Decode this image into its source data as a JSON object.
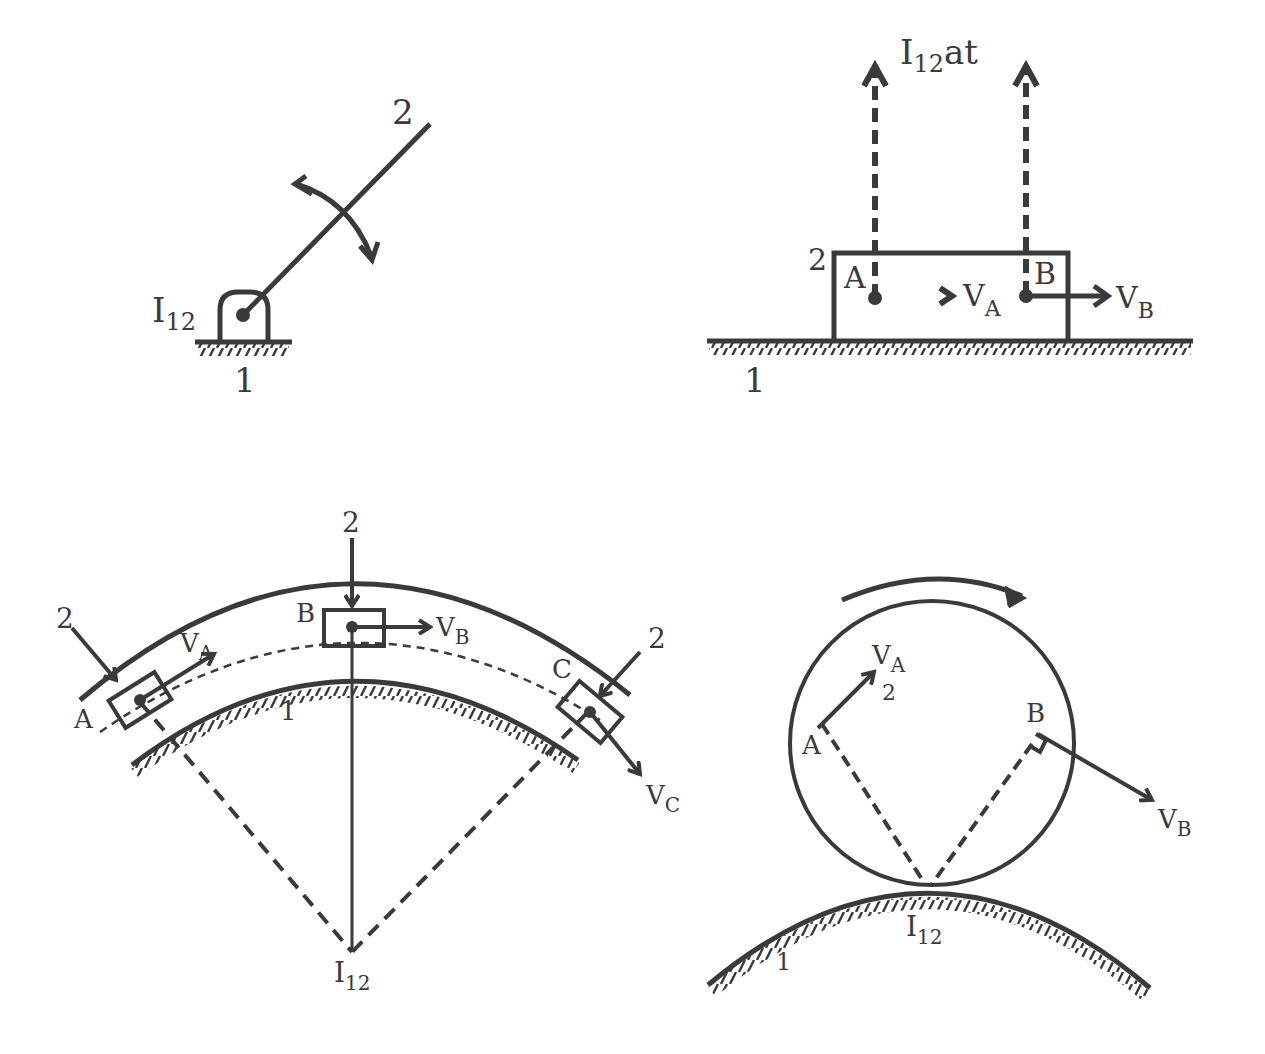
{
  "diagram": {
    "stroke_color": "#3a3a3a",
    "background": "#ffffff",
    "panels": [
      {
        "id": "revolute",
        "labels": {
          "link": "2",
          "ground": "1",
          "center_main": "I",
          "center_sub": "12"
        }
      },
      {
        "id": "prismatic-straight",
        "labels": {
          "link": "2",
          "ground": "1",
          "center_main": "I",
          "center_sub": "12",
          "center_suffix": "at",
          "point_a": "A",
          "point_b": "B",
          "vel_a_main": "V",
          "vel_a_sub": "A",
          "vel_b_main": "V",
          "vel_b_sub": "B"
        }
      },
      {
        "id": "prismatic-curved",
        "labels": {
          "link_left": "2",
          "link_top": "2",
          "link_right": "2",
          "ground": "1",
          "point_a": "A",
          "point_b": "B",
          "point_c": "C",
          "vel_a_main": "V",
          "vel_a_sub": "A",
          "vel_b_main": "V",
          "vel_b_sub": "B",
          "vel_c_main": "V",
          "vel_c_sub": "C",
          "center_main": "I",
          "center_sub": "12"
        }
      },
      {
        "id": "rolling",
        "labels": {
          "link": "2",
          "ground": "1",
          "point_a": "A",
          "point_b": "B",
          "vel_a_main": "V",
          "vel_a_sub": "A",
          "vel_b_main": "V",
          "vel_b_sub": "B",
          "center_main": "I",
          "center_sub": "12"
        }
      }
    ]
  }
}
